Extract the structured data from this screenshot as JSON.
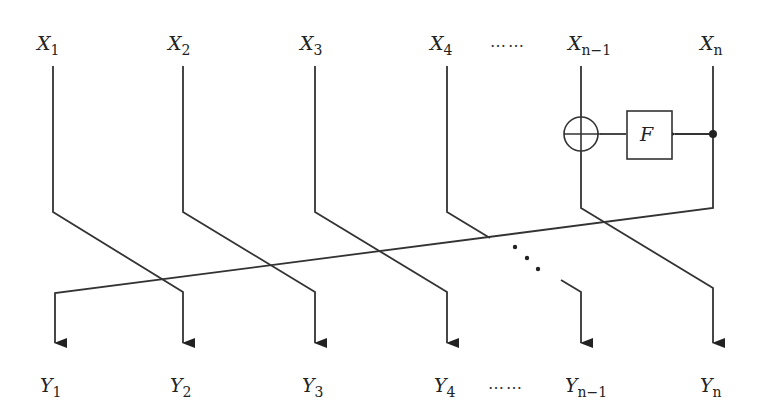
{
  "diagram": {
    "type": "feistel-like permutation network",
    "inputs": [
      {
        "base": "X",
        "sub": "1"
      },
      {
        "base": "X",
        "sub": "2"
      },
      {
        "base": "X",
        "sub": "3"
      },
      {
        "base": "X",
        "sub": "4"
      },
      {
        "base": "X",
        "sub": "n−1"
      },
      {
        "base": "X",
        "sub": "n"
      }
    ],
    "outputs": [
      {
        "base": "Y",
        "sub": "1"
      },
      {
        "base": "Y",
        "sub": "2"
      },
      {
        "base": "Y",
        "sub": "3"
      },
      {
        "base": "Y",
        "sub": "4"
      },
      {
        "base": "Y",
        "sub": "n−1"
      },
      {
        "base": "Y",
        "sub": "n"
      }
    ],
    "ellipsis_top": "……",
    "ellipsis_bottom": "……",
    "function_box_label": "F",
    "xor_symbol": "xor-icon",
    "line_color": "#333333",
    "background": "#ffffff"
  }
}
